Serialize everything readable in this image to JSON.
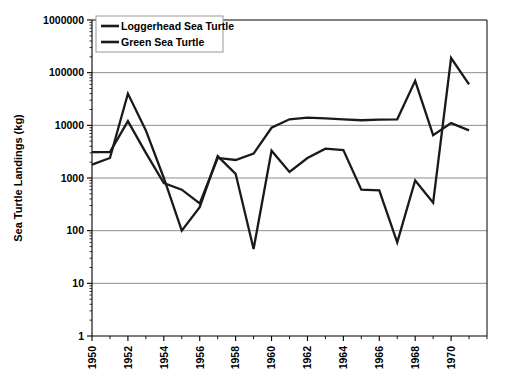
{
  "chart_data": {
    "type": "line",
    "title": "",
    "xlabel": "",
    "ylabel": "Sea Turtle Landings (kg)",
    "yscale": "log",
    "ylim": [
      1,
      1000000
    ],
    "ytick_labels": [
      "1",
      "10",
      "100",
      "1000",
      "10000",
      "100000",
      "1000000"
    ],
    "ytick_values": [
      1,
      10,
      100,
      1000,
      10000,
      100000,
      1000000
    ],
    "xlim": [
      1950,
      1972
    ],
    "xtick_labels": [
      "1950",
      "1952",
      "1954",
      "1956",
      "1958",
      "1960",
      "1962",
      "1964",
      "1966",
      "1968",
      "1970"
    ],
    "xtick_values": [
      1950,
      1952,
      1954,
      1956,
      1958,
      1960,
      1962,
      1964,
      1966,
      1968,
      1970
    ],
    "minor_xticks": [
      1951,
      1953,
      1955,
      1957,
      1959,
      1961,
      1963,
      1965,
      1967,
      1969,
      1971,
      1972
    ],
    "grid": "horizontal",
    "legend_position": "top-left-inside",
    "x": [
      1950,
      1951,
      1952,
      1953,
      1954,
      1955,
      1956,
      1957,
      1958,
      1959,
      1960,
      1961,
      1962,
      1963,
      1964,
      1965,
      1966,
      1967,
      1968,
      1969,
      1970,
      1971
    ],
    "series": [
      {
        "name": "Loggerhead Sea Turtle",
        "color": "#1a1a1a",
        "values": [
          3100,
          3100,
          12000,
          3000,
          800,
          600,
          330,
          2400,
          2200,
          2900,
          9000,
          13000,
          14000,
          13500,
          13000,
          12500,
          12800,
          13000,
          70000,
          6500,
          11000,
          8000
        ]
      },
      {
        "name": "Green Sea Turtle",
        "color": "#1a1a1a",
        "values": [
          1800,
          2400,
          40000,
          8000,
          1000,
          100,
          280,
          2600,
          1200,
          45,
          3300,
          1300,
          2400,
          3600,
          3400,
          600,
          580,
          60,
          900,
          340,
          190000,
          60000
        ]
      }
    ]
  },
  "legend": {
    "items": [
      {
        "label": "Loggerhead Sea Turtle"
      },
      {
        "label": "Green Sea Turtle"
      }
    ]
  }
}
